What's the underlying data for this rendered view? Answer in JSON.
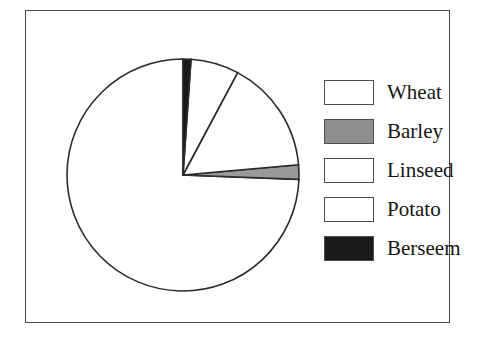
{
  "figure": {
    "background_color": "#ffffff",
    "frame_color": "#4a4a4a"
  },
  "legend": {
    "position": "right",
    "items": [
      {
        "label": "Wheat",
        "color": "#ffffff"
      },
      {
        "label": "Barley",
        "color": "#8e8e8e"
      },
      {
        "label": "Linseed",
        "color": "#ffffff"
      },
      {
        "label": "Potato",
        "color": "#ffffff"
      },
      {
        "label": "Berseem",
        "color": "#1a1a1a"
      }
    ]
  },
  "chart_data": {
    "type": "pie",
    "title": "",
    "subtitle": "",
    "xlabel": "",
    "ylabel": "",
    "labels": [
      "Wheat",
      "Barley",
      "Linseed",
      "Potato",
      "Berseem"
    ],
    "values": [
      74.4,
      2.0,
      15.8,
      6.7,
      1.1
    ],
    "unit": "percent",
    "colors": [
      "#ffffff",
      "#9a9a9a",
      "#ffffff",
      "#ffffff",
      "#1a1a1a"
    ],
    "edge_color": "#2b2b2b",
    "start_angle_deg": 90,
    "direction": "counterclockwise",
    "show_labels": false,
    "show_percentages": false,
    "legend": true,
    "legend_position": "right",
    "grid": false,
    "slice_angles_deg": [
      267.8,
      7.2,
      56.9,
      24.1,
      4.0
    ],
    "geometry": {
      "center_x": 126,
      "center_y": 126,
      "radius": 116
    }
  }
}
